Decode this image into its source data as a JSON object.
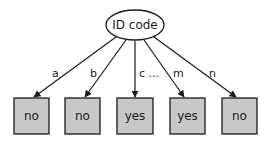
{
  "diagram": {
    "type": "decision-tree",
    "root": {
      "label": "ID code"
    },
    "edges": [
      {
        "label": "a"
      },
      {
        "label": "b"
      },
      {
        "label": "c ..."
      },
      {
        "label": "m"
      },
      {
        "label": "n"
      }
    ],
    "leaves": [
      {
        "label": "no"
      },
      {
        "label": "no"
      },
      {
        "label": "yes"
      },
      {
        "label": "yes"
      },
      {
        "label": "no"
      }
    ],
    "colors": {
      "leaf_fill": "#c8c8c8",
      "stroke": "#1a1a1a",
      "root_fill": "#ffffff"
    }
  }
}
